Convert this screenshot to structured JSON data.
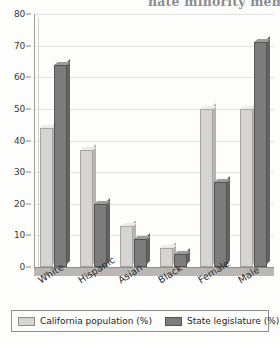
{
  "page": {
    "cut_off_header_fragment": "nate minority membe"
  },
  "legend": {
    "position": "bottom",
    "items": [
      {
        "label": "California population (%)",
        "color": "#d6d4d0",
        "swatch": "light"
      },
      {
        "label": "State legislature (%)",
        "color": "#7c7c7c",
        "swatch": "dark"
      }
    ]
  },
  "axis": {
    "y_ticks": [
      "80",
      "70",
      "60",
      "50",
      "40",
      "30",
      "20",
      "10",
      "0"
    ],
    "x_ticks": [
      "White",
      "Hispanic",
      "Asian",
      "Black",
      "Female",
      "Male"
    ]
  },
  "chart_data": {
    "type": "bar",
    "title": "",
    "xlabel": "",
    "ylabel": "",
    "ylim": [
      0,
      80
    ],
    "ytick_step": 10,
    "grid": true,
    "legend_position": "bottom",
    "categories": [
      "White",
      "Hispanic",
      "Asian",
      "Black",
      "Female",
      "Male"
    ],
    "series": [
      {
        "name": "California population (%)",
        "color": "#d6d4d0",
        "values": [
          44,
          37,
          13,
          6,
          50,
          50
        ]
      },
      {
        "name": "State legislature (%)",
        "color": "#7c7c7c",
        "values": [
          64,
          20,
          9,
          4,
          27,
          71
        ]
      }
    ]
  }
}
